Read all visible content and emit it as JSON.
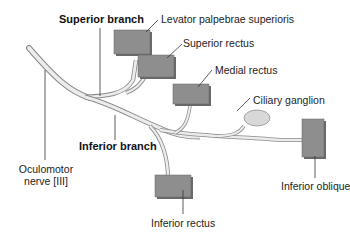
{
  "diagram": {
    "colors": {
      "nerve_fill": "#e6e6e6",
      "nerve_outline": "#8a8a8a",
      "muscle_fill": "#8e8e8e",
      "muscle_side": "#6a6a6a",
      "ganglion_fill": "#d8d8d8",
      "leader_line": "#333333"
    },
    "labels": {
      "superior_branch": "Superior branch",
      "inferior_branch": "Inferior branch",
      "levator": "Levator palpebrae superioris",
      "superior_rectus": "Superior rectus",
      "medial_rectus": "Medial rectus",
      "ciliary_ganglion": "Ciliary ganglion",
      "inferior_oblique": "Inferior oblique",
      "inferior_rectus": "Inferior rectus",
      "oculomotor_line1": "Oculomotor",
      "oculomotor_line2": "nerve [III]"
    }
  }
}
